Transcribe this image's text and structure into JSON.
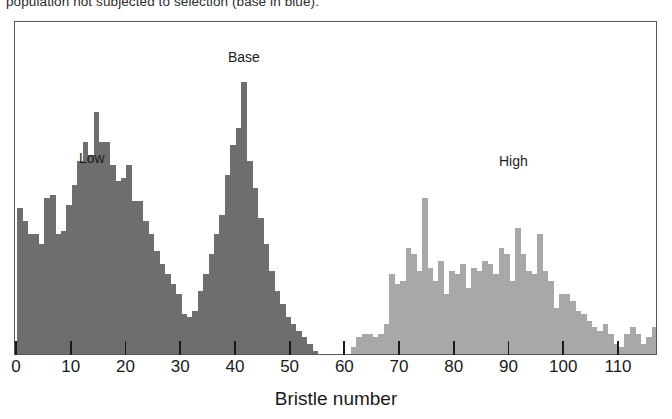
{
  "caption": {
    "top_text": "population not subjected to selection (base in blue)."
  },
  "figure": {
    "xaxis_title": "Bristle number"
  },
  "chart_data": {
    "type": "bar",
    "title": "",
    "subtitle": "",
    "xlabel": "Bristle number",
    "ylabel": "",
    "xlim": [
      0,
      117.5
    ],
    "ylim": [
      0,
      100
    ],
    "grid": false,
    "legend_position": "in-plot annotations",
    "bin_width": 1,
    "annotations": [
      {
        "text": "Low",
        "x": 10,
        "y": 62,
        "color": "#1c1c1c"
      },
      {
        "text": "Base",
        "x": 37,
        "y": 95,
        "color": "#1c1c1c"
      },
      {
        "text": "High",
        "x": 87,
        "y": 61,
        "color": "#1c1c1c"
      }
    ],
    "colors": {
      "low": "#6e6e6e",
      "base": "#6e6e6e",
      "high": "#a8a8a8",
      "frame": "#55585c",
      "axis_text": "#1a1a1a",
      "background": "#ffffff"
    },
    "xticks": [
      0,
      10,
      20,
      30,
      40,
      50,
      60,
      70,
      80,
      90,
      100,
      110
    ],
    "xticklabels": [
      "0",
      "10",
      "20",
      "30",
      "40",
      "50",
      "60",
      "70",
      "80",
      "90",
      "100",
      "110"
    ],
    "series": [
      {
        "name": "Low",
        "color": "#6e6e6e",
        "x": [
          0,
          1,
          2,
          3,
          4,
          5,
          6,
          7,
          8,
          9,
          10,
          11,
          12,
          13,
          14,
          15,
          16,
          17,
          18,
          19,
          20,
          21,
          22,
          23,
          24,
          25,
          26,
          27,
          28,
          29,
          30,
          31,
          32,
          33
        ],
        "values": [
          44,
          40,
          36,
          36,
          33,
          47,
          48,
          36,
          37,
          45,
          51,
          58,
          64,
          60,
          73,
          64,
          64,
          57,
          52,
          53,
          57,
          46,
          46,
          40,
          36,
          31,
          27,
          24,
          21,
          18,
          12,
          9,
          5,
          3
        ]
      },
      {
        "name": "Base",
        "color": "#6e6e6e",
        "x": [
          26,
          27,
          28,
          29,
          30,
          31,
          32,
          33,
          34,
          35,
          36,
          37,
          38,
          39,
          40,
          41,
          42,
          43,
          44,
          45,
          46,
          47,
          48,
          49,
          50,
          51,
          52,
          53,
          54
        ],
        "values": [
          3,
          4,
          5,
          5,
          7,
          11,
          13,
          19,
          24,
          30,
          36,
          42,
          54,
          63,
          68,
          82,
          58,
          50,
          41,
          33,
          25,
          19,
          15,
          11,
          9,
          7,
          5,
          3,
          1
        ]
      },
      {
        "name": "High",
        "color": "#a8a8a8",
        "x": [
          61,
          62,
          63,
          64,
          65,
          66,
          67,
          68,
          69,
          70,
          71,
          72,
          73,
          74,
          75,
          76,
          77,
          78,
          79,
          80,
          81,
          82,
          83,
          84,
          85,
          86,
          87,
          88,
          89,
          90,
          91,
          92,
          93,
          94,
          95,
          96,
          97,
          98,
          99,
          100,
          101,
          102,
          103,
          104,
          105,
          106,
          107,
          108,
          109,
          110,
          111,
          112,
          113,
          114,
          115,
          116
        ],
        "values": [
          2,
          5,
          6,
          6,
          5,
          6,
          9,
          24,
          21,
          22,
          32,
          30,
          25,
          47,
          26,
          22,
          28,
          18,
          25,
          24,
          27,
          20,
          26,
          25,
          28,
          27,
          24,
          32,
          30,
          22,
          38,
          30,
          25,
          24,
          36,
          25,
          22,
          14,
          18,
          18,
          16,
          13,
          12,
          10,
          8,
          7,
          9,
          6,
          3,
          2,
          6,
          8,
          6,
          3,
          5,
          8
        ]
      }
    ]
  }
}
